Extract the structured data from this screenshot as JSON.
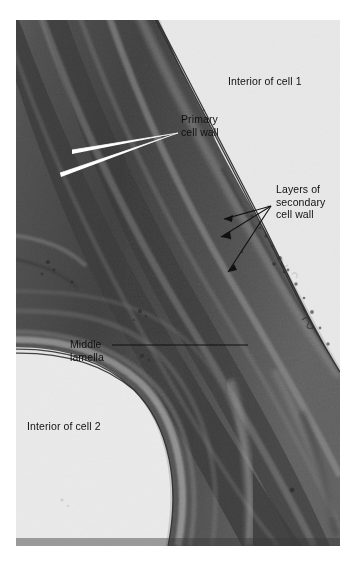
{
  "figure": {
    "kind": "electron-micrograph",
    "plate": {
      "left": 16,
      "top": 20,
      "width": 324,
      "height": 526,
      "background_color": "#e9e9e9",
      "wall_dark_color": "#4a4a4a",
      "wall_mid_color": "#6e6e6e",
      "lumen_color": "#e9e9e9"
    }
  },
  "labels": {
    "interior_cell_1": "Interior of cell 1",
    "primary_cell_wall": "Primary\ncell wall",
    "layers_of_secondary_cell_wall": "Layers of\nsecondary\ncell wall",
    "middle_lamella": "Middle\nlamella",
    "interior_cell_2": "Interior of cell 2"
  },
  "leaders": {
    "primary_cell_wall": {
      "style": "white-double-line",
      "color": "#ffffff",
      "tip": [
        178,
        133
      ],
      "targets": [
        [
          72,
          152
        ],
        [
          60,
          175
        ]
      ]
    },
    "layers_of_secondary_cell_wall": {
      "style": "black-arrow",
      "color": "#111111",
      "origin": [
        271,
        206
      ],
      "targets": [
        [
          224,
          219
        ],
        [
          222,
          236
        ],
        [
          228,
          272
        ]
      ]
    },
    "middle_lamella": {
      "style": "black-line",
      "color": "#111111",
      "from": [
        112,
        345
      ],
      "to": [
        248,
        345
      ]
    }
  }
}
